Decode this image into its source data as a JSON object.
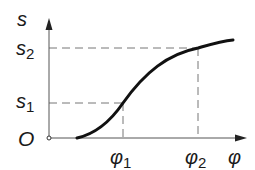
{
  "diagram": {
    "type": "function-graph",
    "axes": {
      "y_label": "s",
      "x_label": "φ",
      "origin_label": "O"
    },
    "ticks": {
      "y": [
        {
          "base": "s",
          "sub": "1"
        },
        {
          "base": "s",
          "sub": "2"
        }
      ],
      "x": [
        {
          "base": "φ",
          "sub": "1"
        },
        {
          "base": "φ",
          "sub": "2"
        }
      ]
    },
    "curve": {
      "description": "S-shaped monotonically increasing curve s(φ), starting on the φ-axis right of the origin, passing through (φ1, s1) and (φ2, s2), flattening toward the right",
      "points": [
        {
          "x": "start",
          "y": 0
        },
        {
          "x": "φ1",
          "y": "s1"
        },
        {
          "x": "φ2",
          "y": "s2"
        }
      ]
    },
    "guides": "dashed projection lines from (φ1, s1) and (φ2, s2) to both axes",
    "colors": {
      "axis": "#555555",
      "curve": "#111111",
      "dash": "#777777",
      "text": "#1a1a1a"
    }
  }
}
